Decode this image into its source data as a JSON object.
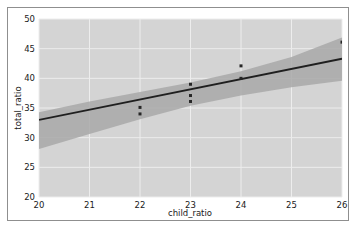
{
  "chart_data": {
    "type": "scatter",
    "title": "",
    "subtitle": "",
    "xlabel": "child_ratio",
    "ylabel": "total_ratio",
    "xlim": [
      20,
      26
    ],
    "ylim": [
      20,
      50
    ],
    "xticks": [
      20,
      21,
      22,
      23,
      24,
      25,
      26
    ],
    "xtick_labels": [
      "20",
      "21",
      "22",
      "23",
      "24",
      "25",
      "26"
    ],
    "yticks": [
      20,
      25,
      30,
      35,
      40,
      45,
      50
    ],
    "ytick_labels": [
      "20",
      "25",
      "30",
      "35",
      "40",
      "45",
      "50"
    ],
    "grid": true,
    "legend": null,
    "legend_position": "none",
    "plot_background": "#d4d4d4",
    "grid_color": "#ededed",
    "point_color": "#262626",
    "line_color": "#1f1f1f",
    "band_color": "#a8a8a8",
    "points": [
      {
        "x": 22,
        "y": 35.1
      },
      {
        "x": 22,
        "y": 34.0
      },
      {
        "x": 23,
        "y": 39.0
      },
      {
        "x": 23,
        "y": 37.1
      },
      {
        "x": 23,
        "y": 36.1
      },
      {
        "x": 24,
        "y": 42.1
      },
      {
        "x": 24,
        "y": 40.0
      },
      {
        "x": 26,
        "y": 46.1
      }
    ],
    "regression_line": {
      "x": [
        20,
        26
      ],
      "y": [
        33.0,
        43.3
      ]
    },
    "confidence_band": {
      "x": [
        20,
        21,
        22,
        23,
        24,
        25,
        26
      ],
      "lower": [
        28.1,
        30.6,
        33.1,
        35.4,
        37.1,
        38.5,
        39.6
      ],
      "upper": [
        34.3,
        36.1,
        37.7,
        39.3,
        41.2,
        43.6,
        46.9
      ]
    },
    "series": [
      {
        "name": "observations",
        "values": [
          35.1,
          34.0,
          39.0,
          37.1,
          36.1,
          42.1,
          40.0,
          46.1
        ]
      }
    ]
  },
  "axis": {
    "x_title": "child_ratio",
    "y_title": "total_ratio",
    "x_labels": [
      "20",
      "21",
      "22",
      "23",
      "24",
      "25",
      "26"
    ],
    "y_labels": [
      "50",
      "45",
      "40",
      "35",
      "30",
      "25",
      "20"
    ]
  }
}
